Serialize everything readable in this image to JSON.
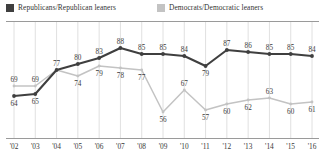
{
  "legend": {
    "position": "top",
    "items": [
      {
        "label": "Republicans/Republican leaners",
        "swatch_name": "legend-swatch-republicans",
        "color": "#3f3f3f"
      },
      {
        "label": "Democrats/Democratic leaners",
        "swatch_name": "legend-swatch-democrats",
        "color": "#c3c3c3"
      }
    ]
  },
  "chart_data": {
    "type": "line",
    "title": "",
    "subtitle": "",
    "xlabel": "",
    "ylabel": "",
    "ylim": [
      50,
      95
    ],
    "grid": "vertical",
    "legend_position": "top",
    "categories": [
      "'02",
      "'03",
      "'04",
      "'05",
      "'06",
      "'07",
      "'08",
      "'09",
      "'10",
      "'11",
      "'12",
      "'13",
      "'14",
      "'15",
      "'16"
    ],
    "series": [
      {
        "name": "Republicans/Republican leaners",
        "color": "#3f3f3f",
        "values": [
          64,
          65,
          77,
          80,
          83,
          88,
          85,
          85,
          84,
          79,
          87,
          86,
          85,
          85,
          84
        ],
        "label_positions": [
          "below",
          "below",
          "above",
          "above",
          "above",
          "above",
          "above",
          "above",
          "above",
          "below",
          "above",
          "above",
          "above",
          "above",
          "above"
        ]
      },
      {
        "name": "Democrats/Democratic leaners",
        "color": "#c3c3c3",
        "values": [
          69,
          69,
          77,
          74,
          79,
          78,
          77,
          56,
          67,
          57,
          60,
          62,
          63,
          60,
          61
        ],
        "label_positions": [
          "above",
          "above",
          "hidden",
          "below",
          "below",
          "below",
          "below",
          "below",
          "above",
          "below",
          "below",
          "below",
          "above",
          "below",
          "below"
        ]
      }
    ]
  }
}
